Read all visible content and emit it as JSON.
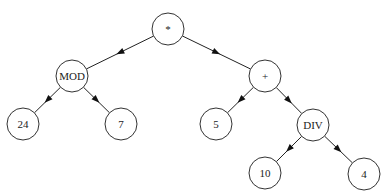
{
  "diagram": {
    "type": "expression-tree",
    "node_radius": 16,
    "colors": {
      "stroke": "#333333",
      "text": "#222222",
      "background": "#ffffff"
    },
    "nodes": [
      {
        "id": "root",
        "label": "*",
        "x": 168,
        "y": 29
      },
      {
        "id": "mod",
        "label": "MOD",
        "x": 72,
        "y": 76
      },
      {
        "id": "plus",
        "label": "+",
        "x": 265,
        "y": 76
      },
      {
        "id": "n24",
        "label": "24",
        "x": 23,
        "y": 124
      },
      {
        "id": "n7",
        "label": "7",
        "x": 121,
        "y": 124
      },
      {
        "id": "n5",
        "label": "5",
        "x": 216,
        "y": 124
      },
      {
        "id": "div",
        "label": "DIV",
        "x": 313,
        "y": 125
      },
      {
        "id": "n10",
        "label": "10",
        "x": 265,
        "y": 173
      },
      {
        "id": "n4",
        "label": "4",
        "x": 364,
        "y": 174
      }
    ],
    "edges": [
      {
        "from": "root",
        "to": "mod"
      },
      {
        "from": "root",
        "to": "plus"
      },
      {
        "from": "mod",
        "to": "n24"
      },
      {
        "from": "mod",
        "to": "n7"
      },
      {
        "from": "plus",
        "to": "n5"
      },
      {
        "from": "plus",
        "to": "div"
      },
      {
        "from": "div",
        "to": "n10"
      },
      {
        "from": "div",
        "to": "n4"
      }
    ]
  }
}
